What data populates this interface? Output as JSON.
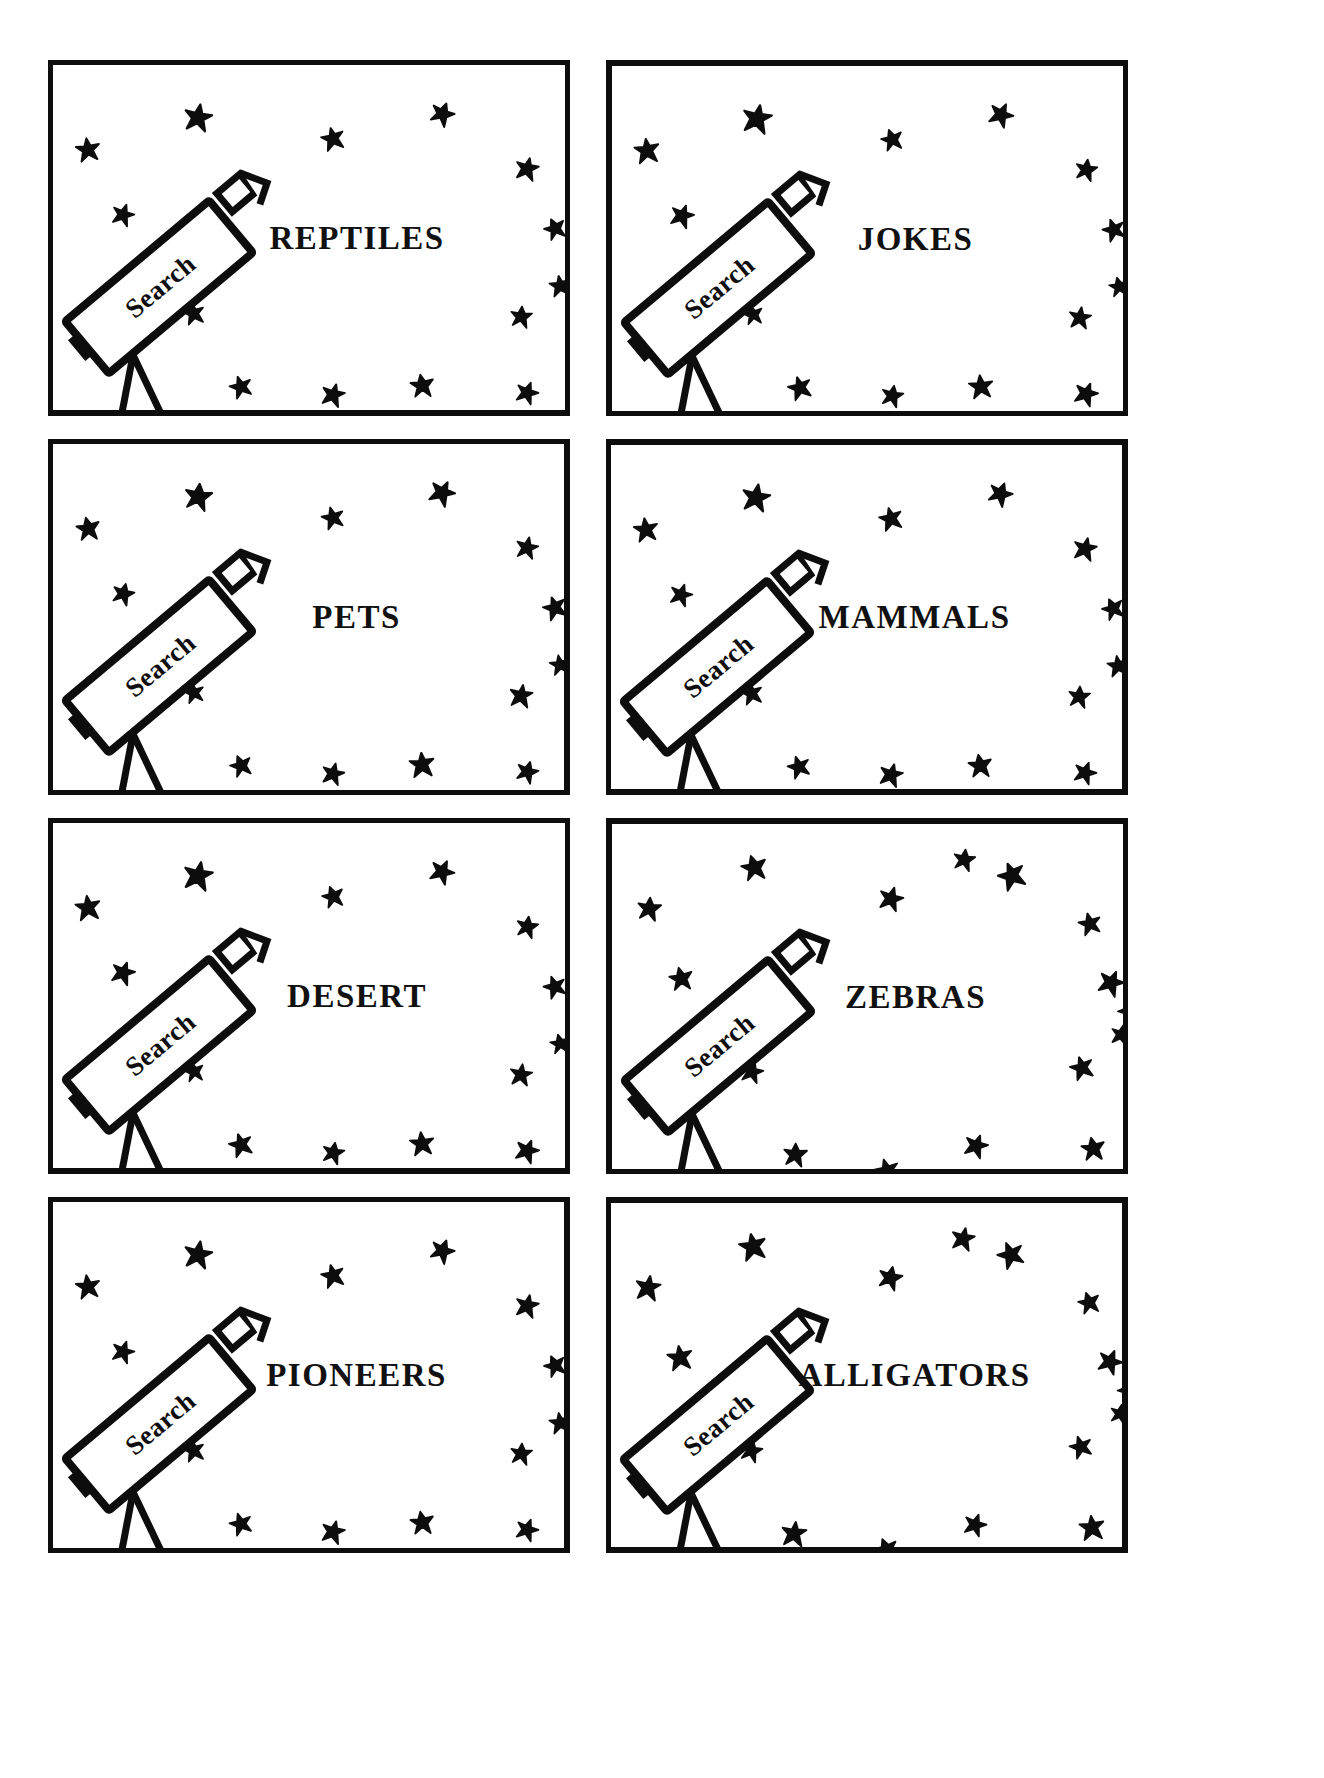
{
  "page": {
    "background_color": "#ffffff",
    "ink_color": "#0d0d0d",
    "layout": "4-rows-by-2-columns-card-grid",
    "card_count": 8
  },
  "telescope": {
    "tube_label": "Search",
    "icon_name": "telescope-icon",
    "parts": [
      "tube",
      "eyepiece",
      "finder-scope",
      "mount-knob",
      "tripod-leg-left",
      "tripod-leg-right"
    ]
  },
  "star": {
    "icon_name": "star-icon",
    "fill": "#0d0d0d",
    "points": 5
  },
  "cards": [
    {
      "id": "card-reptiles",
      "title": "REPTILES",
      "search_label": "Search",
      "row": 1,
      "col": 1,
      "star_count": 14
    },
    {
      "id": "card-jokes",
      "title": "JOKES",
      "search_label": "Search",
      "row": 1,
      "col": 2,
      "star_count": 14
    },
    {
      "id": "card-pets",
      "title": "PETS",
      "search_label": "Search",
      "row": 2,
      "col": 1,
      "star_count": 14
    },
    {
      "id": "card-mammals",
      "title": "MAMMALS",
      "search_label": "Search",
      "row": 2,
      "col": 2,
      "star_count": 14
    },
    {
      "id": "card-desert",
      "title": "DESERT",
      "search_label": "Search",
      "row": 3,
      "col": 1,
      "star_count": 14
    },
    {
      "id": "card-zebras",
      "title": "ZEBRAS",
      "search_label": "Search",
      "row": 3,
      "col": 2,
      "star_count": 16
    },
    {
      "id": "card-pioneers",
      "title": "PIONEERS",
      "search_label": "Search",
      "row": 4,
      "col": 1,
      "star_count": 14
    },
    {
      "id": "card-alligators",
      "title": "ALLIGATORS",
      "search_label": "Search",
      "row": 4,
      "col": 2,
      "star_count": 16
    }
  ],
  "star_layouts": {
    "a": [
      {
        "x": 130,
        "y": 38,
        "s": 30,
        "r": 10
      },
      {
        "x": 268,
        "y": 62,
        "s": 24,
        "r": -15
      },
      {
        "x": 376,
        "y": 36,
        "s": 26,
        "r": 25
      },
      {
        "x": 22,
        "y": 72,
        "s": 26,
        "r": -8
      },
      {
        "x": 462,
        "y": 92,
        "s": 24,
        "r": 12
      },
      {
        "x": 490,
        "y": 152,
        "s": 24,
        "r": -20
      },
      {
        "x": 58,
        "y": 138,
        "s": 24,
        "r": 18
      },
      {
        "x": 130,
        "y": 238,
        "s": 22,
        "r": -12
      },
      {
        "x": 456,
        "y": 240,
        "s": 24,
        "r": 8
      },
      {
        "x": 176,
        "y": 310,
        "s": 24,
        "r": -18
      },
      {
        "x": 268,
        "y": 318,
        "s": 24,
        "r": 14
      },
      {
        "x": 356,
        "y": 308,
        "s": 26,
        "r": -6
      },
      {
        "x": 462,
        "y": 316,
        "s": 24,
        "r": 20
      },
      {
        "x": 496,
        "y": 210,
        "s": 22,
        "r": -10
      }
    ],
    "b": [
      {
        "x": 128,
        "y": 30,
        "s": 28,
        "r": -12
      },
      {
        "x": 266,
        "y": 62,
        "s": 26,
        "r": 16
      },
      {
        "x": 386,
        "y": 38,
        "s": 28,
        "r": -22
      },
      {
        "x": 24,
        "y": 72,
        "s": 26,
        "r": 8
      },
      {
        "x": 466,
        "y": 88,
        "s": 24,
        "r": -14
      },
      {
        "x": 486,
        "y": 146,
        "s": 26,
        "r": 22
      },
      {
        "x": 56,
        "y": 142,
        "s": 26,
        "r": -9
      },
      {
        "x": 128,
        "y": 236,
        "s": 24,
        "r": 15
      },
      {
        "x": 458,
        "y": 232,
        "s": 24,
        "r": -18
      },
      {
        "x": 170,
        "y": 318,
        "s": 26,
        "r": 6
      },
      {
        "x": 262,
        "y": 334,
        "s": 26,
        "r": -16
      },
      {
        "x": 352,
        "y": 310,
        "s": 24,
        "r": 19
      },
      {
        "x": 468,
        "y": 312,
        "s": 26,
        "r": -7
      },
      {
        "x": 498,
        "y": 200,
        "s": 22,
        "r": 13
      },
      {
        "x": 506,
        "y": 176,
        "s": 22,
        "r": -25
      },
      {
        "x": 340,
        "y": 24,
        "s": 24,
        "r": 11
      }
    ]
  }
}
